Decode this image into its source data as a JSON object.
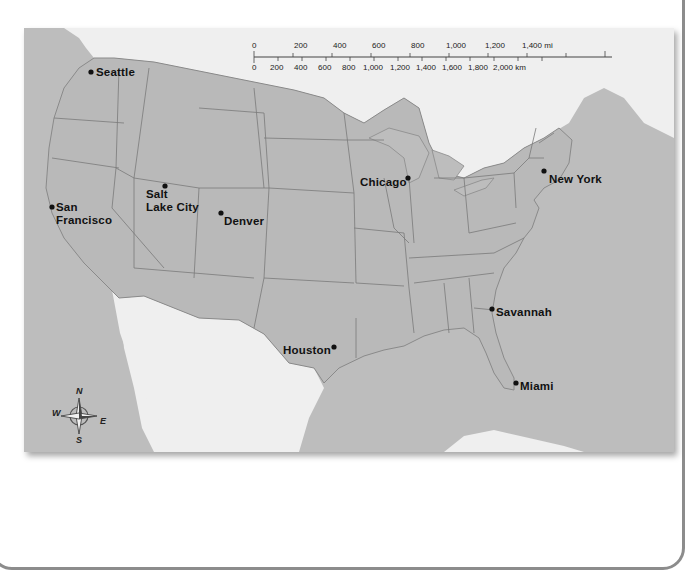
{
  "map": {
    "title": "",
    "colors": {
      "us_land": "#b9b9b9",
      "water": "#bdbdbd",
      "foreign_land": "#efefef",
      "state_borders": "#7a7a7a",
      "frame": "#8c8c8c"
    },
    "cities": [
      {
        "name": "Seattle",
        "label": "Seattle"
      },
      {
        "name": "San Francisco",
        "label_line1": "San",
        "label_line2": "Francisco"
      },
      {
        "name": "Salt Lake City",
        "label_line1": "Salt",
        "label_line2": "Lake City"
      },
      {
        "name": "Denver",
        "label": "Denver"
      },
      {
        "name": "Chicago",
        "label": "Chicago"
      },
      {
        "name": "New York",
        "label": "New York"
      },
      {
        "name": "Houston",
        "label": "Houston"
      },
      {
        "name": "Savannah",
        "label": "Savannah"
      },
      {
        "name": "Miami",
        "label": "Miami"
      }
    ],
    "scale_bar": {
      "miles_ticks": [
        "0",
        "200",
        "400",
        "600",
        "800",
        "1,000",
        "1,200",
        "1,400 mi"
      ],
      "km_ticks": [
        "0",
        "200",
        "400",
        "600",
        "800",
        "1,000",
        "1,200",
        "1,400",
        "1,600",
        "1,800",
        "2,000 km"
      ]
    },
    "compass": {
      "n": "N",
      "s": "S",
      "e": "E",
      "w": "W"
    }
  }
}
